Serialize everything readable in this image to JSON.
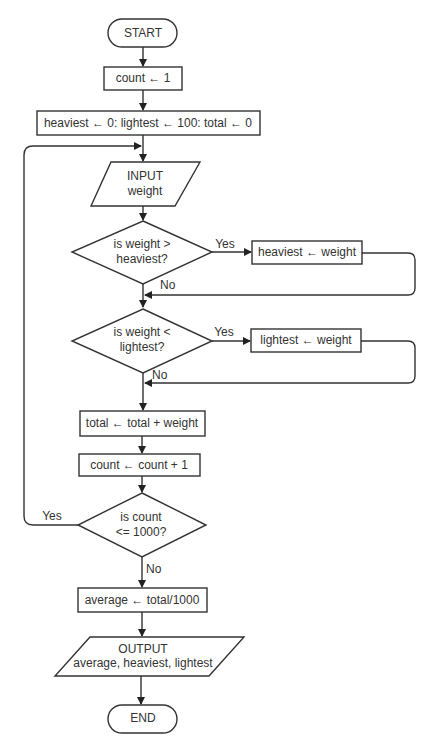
{
  "diagram": {
    "type": "flowchart",
    "nodes": {
      "start": {
        "shape": "terminator",
        "label": "START"
      },
      "init_count": {
        "shape": "process",
        "label": "count ← 1"
      },
      "init_vars": {
        "shape": "process",
        "label": "heaviest ← 0: lightest ← 100: total ← 0"
      },
      "input": {
        "shape": "io",
        "line1": "INPUT",
        "line2": "weight"
      },
      "dec_heavy": {
        "shape": "decision",
        "line1": "is weight  >",
        "line2": "heaviest?"
      },
      "set_heavy": {
        "shape": "process",
        "label": "heaviest ← weight"
      },
      "dec_light": {
        "shape": "decision",
        "line1": "is weight  <",
        "line2": "lightest?"
      },
      "set_light": {
        "shape": "process",
        "label": "lightest ← weight"
      },
      "add_total": {
        "shape": "process",
        "label": "total ← total + weight"
      },
      "inc_count": {
        "shape": "process",
        "label": "count ← count + 1"
      },
      "dec_count": {
        "shape": "decision",
        "line1": "is count",
        "line2": "<= 1000?"
      },
      "average": {
        "shape": "process",
        "label": "average ← total/1000"
      },
      "output": {
        "shape": "io",
        "line1": "OUTPUT",
        "line2": "average, heaviest, lightest"
      },
      "end": {
        "shape": "terminator",
        "label": "END"
      }
    },
    "edge_labels": {
      "heavy_yes": "Yes",
      "heavy_no": "No",
      "light_yes": "Yes",
      "light_no": "No",
      "count_yes": "Yes",
      "count_no": "No"
    },
    "edges": [
      [
        "start",
        "init_count"
      ],
      [
        "init_count",
        "init_vars"
      ],
      [
        "init_vars",
        "input"
      ],
      [
        "input",
        "dec_heavy"
      ],
      [
        "dec_heavy",
        "set_heavy",
        "Yes"
      ],
      [
        "dec_heavy",
        "dec_light",
        "No"
      ],
      [
        "set_heavy",
        "dec_light"
      ],
      [
        "dec_light",
        "set_light",
        "Yes"
      ],
      [
        "dec_light",
        "add_total",
        "No"
      ],
      [
        "set_light",
        "add_total"
      ],
      [
        "add_total",
        "inc_count"
      ],
      [
        "inc_count",
        "dec_count"
      ],
      [
        "dec_count",
        "input",
        "Yes"
      ],
      [
        "dec_count",
        "average",
        "No"
      ],
      [
        "average",
        "output"
      ],
      [
        "output",
        "end"
      ]
    ]
  }
}
